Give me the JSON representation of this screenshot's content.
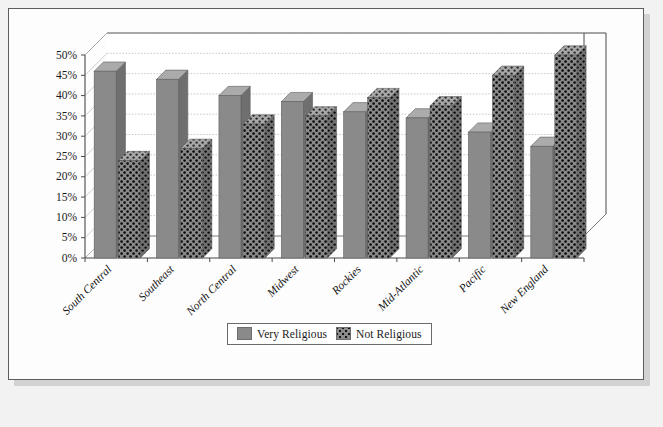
{
  "chart_data": {
    "type": "bar",
    "title": "",
    "subtitle": "",
    "xlabel": "",
    "ylabel": "",
    "categories": [
      "South Central",
      "Southeast",
      "North Central",
      "Midwest",
      "Rockies",
      "Mid-Atlantic",
      "Pacific",
      "New England"
    ],
    "series": [
      {
        "name": "Very Religious",
        "color": "#8a8a8a",
        "pattern": "solid",
        "values": [
          46,
          44,
          40,
          38.5,
          36,
          34.5,
          31,
          27.5
        ]
      },
      {
        "name": "Not Religious",
        "color": "#8a8a8a",
        "pattern": "dotted",
        "values": [
          24,
          27,
          33,
          35,
          39.5,
          37.5,
          45,
          50
        ]
      }
    ],
    "ylim": [
      0,
      50
    ],
    "ytick_values": [
      0,
      5,
      10,
      15,
      20,
      25,
      30,
      35,
      40,
      45,
      50
    ],
    "ytick_labels": [
      "0%",
      "5%",
      "10%",
      "15%",
      "20%",
      "25%",
      "30%",
      "35%",
      "40%",
      "45%",
      "50%"
    ],
    "grid": true,
    "grid_axis": "y",
    "legend_position": "bottom",
    "style": "3d-column",
    "xtick_label_rotation": -45
  },
  "legend": {
    "entries": [
      {
        "label": "Very Religious",
        "swatch": "solid-gray-swatch"
      },
      {
        "label": "Not Religious",
        "swatch": "dotted-gray-swatch"
      }
    ]
  }
}
